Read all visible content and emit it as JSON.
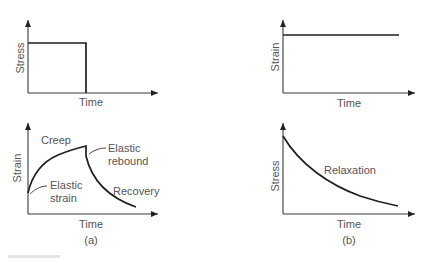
{
  "panels": [
    {
      "id": "a",
      "caption": "(a)",
      "top": {
        "y_label": "Stress",
        "x_label": "Time",
        "description": "Constant stress applied then removed (step)"
      },
      "bottom": {
        "y_label": "Strain",
        "x_label": "Time",
        "annotations": {
          "creep": "Creep",
          "elastic_rebound_1": "Elastic",
          "elastic_rebound_2": "rebound",
          "elastic_strain_1": "Elastic",
          "elastic_strain_2": "strain",
          "recovery": "Recovery"
        }
      }
    },
    {
      "id": "b",
      "caption": "(b)",
      "top": {
        "y_label": "Strain",
        "x_label": "Time",
        "description": "Constant strain held"
      },
      "bottom": {
        "y_label": "Stress",
        "x_label": "Time",
        "annotations": {
          "relaxation": "Relaxation"
        }
      }
    }
  ],
  "colors": {
    "line": "#1e1e1e",
    "text": "#555555",
    "background": "#ffffff"
  }
}
